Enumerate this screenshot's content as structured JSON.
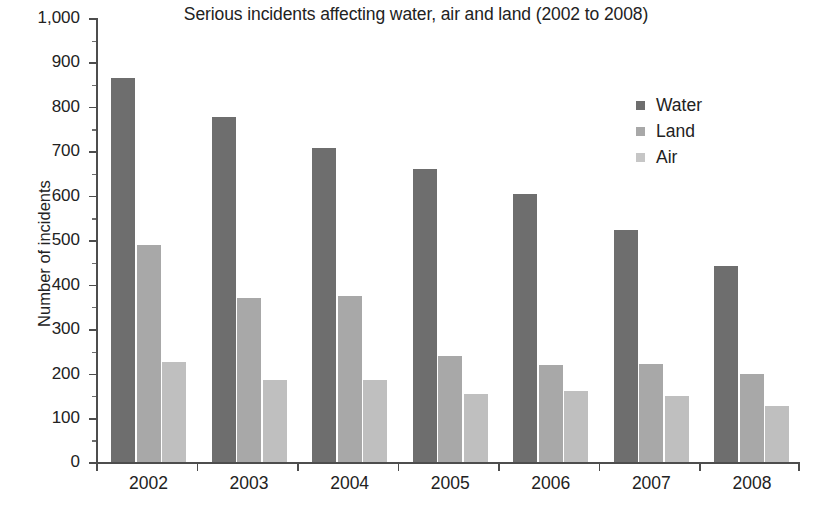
{
  "chart_data": {
    "type": "bar",
    "title": "Serious incidents affecting water, air and land (2002 to 2008)",
    "xlabel": "",
    "ylabel": "Number of incidents",
    "ylim": [
      0,
      1000
    ],
    "ytick_step": 100,
    "grid": false,
    "legend_position": "top-right",
    "categories": [
      "2002",
      "2003",
      "2004",
      "2005",
      "2006",
      "2007",
      "2008"
    ],
    "ytick_labels": [
      "0",
      "100",
      "200",
      "300",
      "400",
      "500",
      "600",
      "700",
      "800",
      "900",
      "1,000"
    ],
    "series": [
      {
        "name": "Water",
        "color": "#6e6e6e",
        "values": [
          865,
          778,
          708,
          660,
          605,
          522,
          442
        ]
      },
      {
        "name": "Land",
        "color": "#a8a8a8",
        "values": [
          490,
          370,
          375,
          240,
          220,
          222,
          200
        ]
      },
      {
        "name": "Air",
        "color": "#bfbfbf",
        "values": [
          225,
          185,
          185,
          155,
          160,
          150,
          128
        ]
      }
    ]
  },
  "legend": {
    "items": [
      {
        "label": "Water",
        "swatch": "legend-swatch-water"
      },
      {
        "label": "Land",
        "swatch": "legend-swatch-land"
      },
      {
        "label": "Air",
        "swatch": "legend-swatch-air"
      }
    ]
  }
}
